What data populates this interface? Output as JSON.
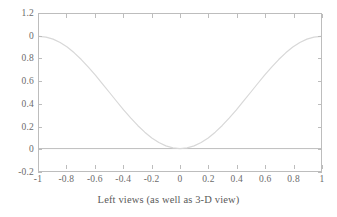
{
  "chart_data": {
    "type": "line",
    "title": "",
    "xlabel": "Left views (as well as 3-D view)",
    "ylabel": "",
    "xlim": [
      -1,
      1
    ],
    "ylim": [
      -0.2,
      1.2
    ],
    "grid": false,
    "legend": null,
    "frame": true,
    "zero_line": true,
    "line_color": "#d8d8d8",
    "axis_color": "#bdbdbd",
    "text_color": "#5a5a5a",
    "background": "#ffffff",
    "xticks": [
      -1,
      -0.8,
      -0.6,
      -0.4,
      -0.2,
      0,
      0.2,
      0.4,
      0.6,
      0.8,
      1
    ],
    "xticklabels": [
      "-1",
      "-0.8",
      "-0.6",
      "-0.4",
      "-0.2",
      "0",
      "0.2",
      "0.4",
      "0.6",
      "0.8",
      "1"
    ],
    "yticks": [
      1.2,
      1.0,
      0.8,
      0.6,
      0.4,
      0.2,
      0,
      -0.2
    ],
    "yticklabels": [
      "1.2",
      "0",
      "0.8",
      "0.6",
      "0.4",
      "0.2",
      "0",
      "-0.2"
    ],
    "series": [
      {
        "name": "curve",
        "x": [
          -1,
          -0.95,
          -0.9,
          -0.85,
          -0.8,
          -0.75,
          -0.7,
          -0.65,
          -0.6,
          -0.55,
          -0.5,
          -0.45,
          -0.4,
          -0.35,
          -0.3,
          -0.25,
          -0.2,
          -0.15,
          -0.1,
          -0.05,
          0,
          0.05,
          0.1,
          0.15,
          0.2,
          0.25,
          0.3,
          0.35,
          0.4,
          0.45,
          0.5,
          0.55,
          0.6,
          0.65,
          0.7,
          0.75,
          0.8,
          0.85,
          0.9,
          0.95,
          1
        ],
        "y": [
          1.0,
          0.994,
          0.976,
          0.946,
          0.905,
          0.854,
          0.794,
          0.727,
          0.655,
          0.578,
          0.5,
          0.422,
          0.345,
          0.273,
          0.206,
          0.146,
          0.095,
          0.054,
          0.024,
          0.006,
          0.0,
          0.006,
          0.024,
          0.054,
          0.095,
          0.146,
          0.206,
          0.273,
          0.345,
          0.422,
          0.5,
          0.578,
          0.655,
          0.727,
          0.794,
          0.854,
          0.905,
          0.946,
          0.976,
          0.994,
          1.0
        ]
      }
    ]
  }
}
